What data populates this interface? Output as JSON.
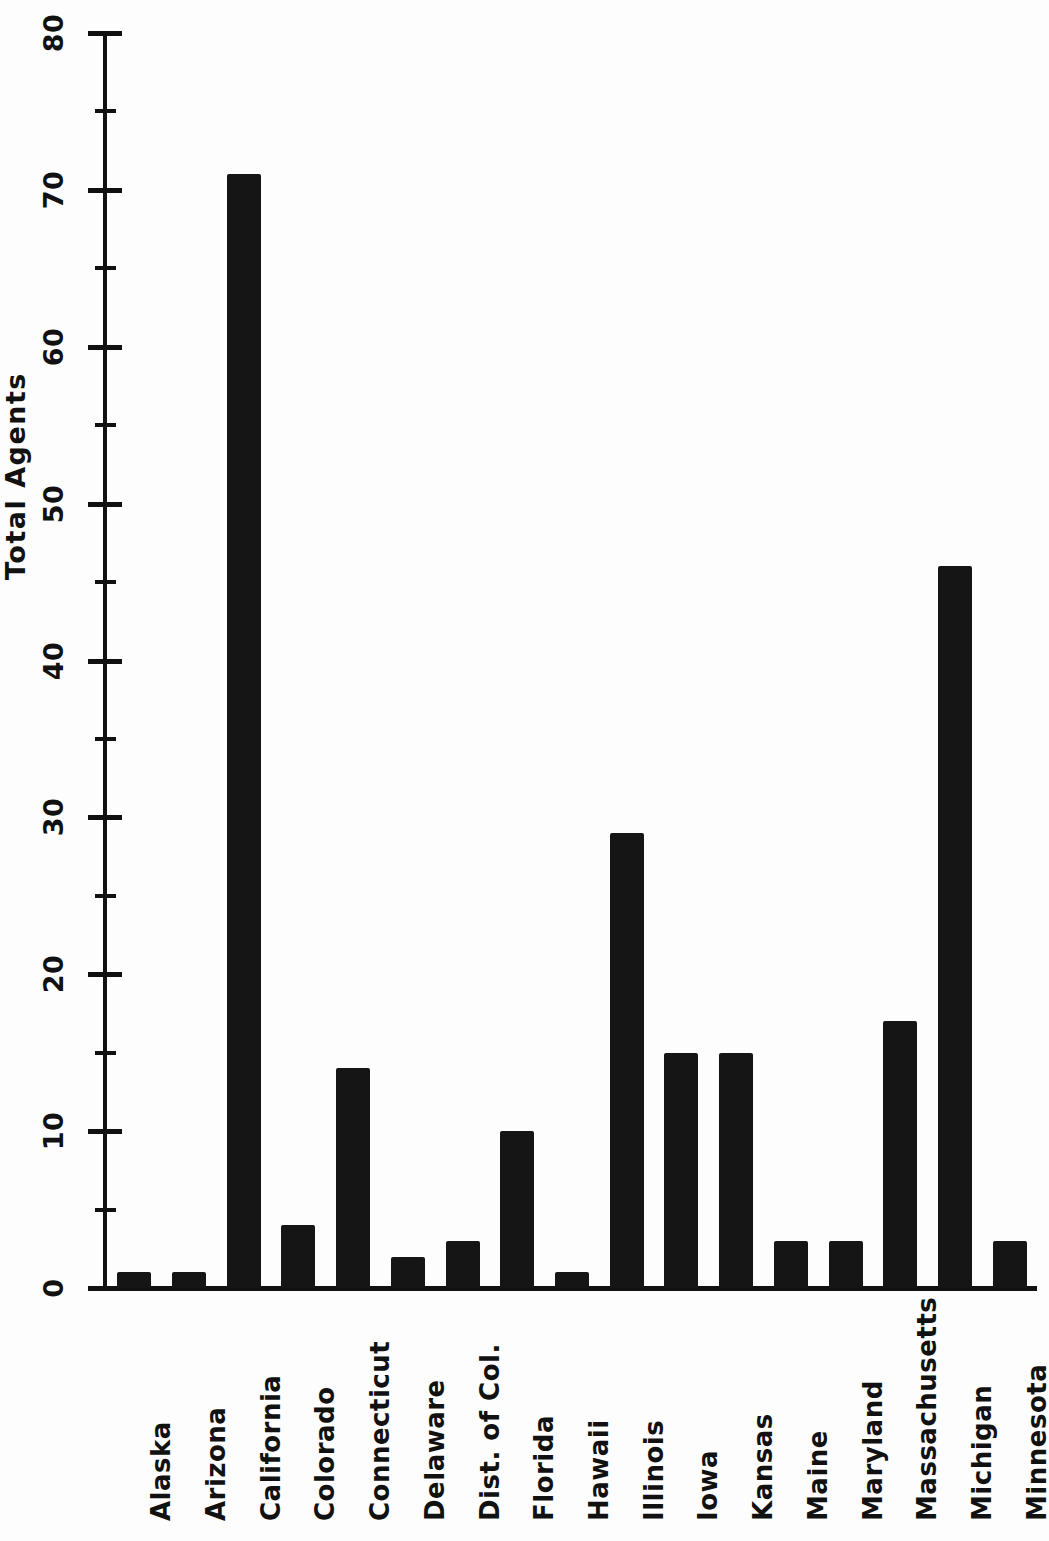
{
  "chart_data": {
    "type": "bar",
    "title": "",
    "xlabel": "",
    "ylabel": "Total Agents",
    "ylim": [
      0,
      80
    ],
    "ytick_labels": [
      "0",
      "10",
      "20",
      "30",
      "40",
      "50",
      "60",
      "70",
      "80"
    ],
    "ytick_values": [
      0,
      10,
      20,
      30,
      40,
      50,
      60,
      70,
      80
    ],
    "yminor_values": [
      5,
      15,
      25,
      35,
      45,
      55,
      65,
      75
    ],
    "grid": false,
    "legend": null,
    "bar_color": "#151515",
    "categories": [
      "Alaska",
      "Arizona",
      "California",
      "Colorado",
      "Connecticut",
      "Delaware",
      "Dist. of Col.",
      "Florida",
      "Hawaii",
      "Illinois",
      "Iowa",
      "Kansas",
      "Maine",
      "Maryland",
      "Massachusetts",
      "Michigan",
      "Minnesota"
    ],
    "values": [
      1,
      1,
      71,
      4,
      14,
      2,
      3,
      10,
      1,
      29,
      15,
      15,
      3,
      3,
      17,
      46,
      3
    ]
  }
}
